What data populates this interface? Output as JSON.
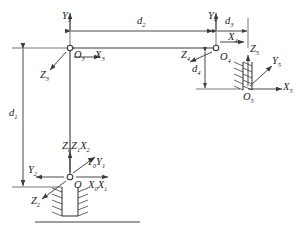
{
  "diagram": {
    "type": "kinematic-link-frame-diagram",
    "stroke_color": "#3d3d3d",
    "text_color": "#1a1a1a",
    "frames": [
      {
        "id": "frame-0-1-2",
        "origin_label": "O",
        "origin_sub": "",
        "axes": [
          {
            "name": "z-axis-0-1-and-x-axis-2",
            "label": "Z",
            "sub": "0",
            "label2": "Z",
            "sub2": "1",
            "label3": "X",
            "sub3": "2",
            "direction": "up"
          },
          {
            "name": "y-axis-0-1",
            "label": "Y",
            "sub": "0",
            "label2": "Y",
            "sub2": "1",
            "direction": "up-right"
          },
          {
            "name": "x-axis-0-1",
            "label": "X",
            "sub": "0",
            "label2": "X",
            "sub2": "1",
            "direction": "right"
          },
          {
            "name": "y-axis-2",
            "label": "Y",
            "sub": "2",
            "direction": "left"
          },
          {
            "name": "z-axis-2",
            "label": "Z",
            "sub": "2",
            "direction": "down-left"
          }
        ]
      },
      {
        "id": "frame-3",
        "origin_label": "O",
        "origin_sub": "3",
        "axes": [
          {
            "name": "x-axis-3",
            "label": "X",
            "sub": "3",
            "direction": "right"
          },
          {
            "name": "y-axis-3",
            "label": "Y",
            "sub": "3",
            "direction": "up"
          },
          {
            "name": "z-axis-3",
            "label": "Z",
            "sub": "3",
            "direction": "down-left"
          }
        ]
      },
      {
        "id": "frame-4",
        "origin_label": "O",
        "origin_sub": "4",
        "axes": [
          {
            "name": "x-axis-4",
            "label": "X",
            "sub": "4",
            "direction": "right"
          },
          {
            "name": "y-axis-4",
            "label": "Y",
            "sub": "4",
            "direction": "up"
          },
          {
            "name": "z-axis-4",
            "label": "Z",
            "sub": "4",
            "direction": "left"
          }
        ]
      },
      {
        "id": "frame-5",
        "origin_label": "O",
        "origin_sub": "5",
        "axes": [
          {
            "name": "x-axis-5",
            "label": "X",
            "sub": "5",
            "direction": "right"
          },
          {
            "name": "y-axis-5",
            "label": "Y",
            "sub": "5",
            "direction": "up-right"
          },
          {
            "name": "z-axis-5",
            "label": "Z",
            "sub": "5",
            "direction": "up"
          }
        ]
      }
    ],
    "dimensions": [
      {
        "name": "dimension-d1",
        "label": "d",
        "sub": "1",
        "orientation": "vertical",
        "location": "left-column"
      },
      {
        "name": "dimension-d2",
        "label": "d",
        "sub": "2",
        "orientation": "horizontal",
        "location": "top-beam"
      },
      {
        "name": "dimension-d3",
        "label": "d",
        "sub": "3",
        "orientation": "horizontal",
        "location": "top-right"
      },
      {
        "name": "dimension-d4",
        "label": "d",
        "sub": "4",
        "orientation": "vertical",
        "location": "right-column"
      }
    ],
    "ground_symbols": [
      {
        "name": "ground-hatch-base",
        "location": "below-origin-O"
      },
      {
        "name": "ground-hatch-end-effector",
        "location": "at-origin-O5"
      }
    ]
  }
}
